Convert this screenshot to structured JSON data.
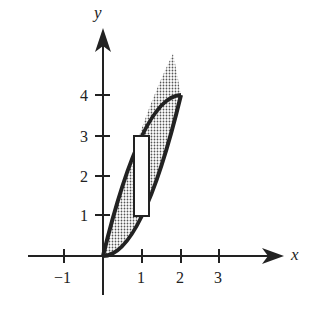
{
  "diagram": {
    "axes": {
      "x_label": "x",
      "y_label": "y",
      "x_ticks": [
        {
          "value": -1,
          "label": "−1"
        },
        {
          "value": 1,
          "label": "1"
        },
        {
          "value": 2,
          "label": "2"
        },
        {
          "value": 3,
          "label": "3"
        }
      ],
      "y_ticks": [
        {
          "value": 1,
          "label": "1"
        },
        {
          "value": 2,
          "label": "2"
        },
        {
          "value": 3,
          "label": "3"
        },
        {
          "value": 4,
          "label": "4"
        }
      ]
    },
    "curves": [
      {
        "name": "upper",
        "equation": "y = 4x - x^2",
        "x_range": [
          0,
          2
        ]
      },
      {
        "name": "lower",
        "equation": "y = x^2",
        "x_range": [
          0,
          2
        ]
      }
    ],
    "shaded_region": {
      "between": [
        "upper",
        "lower"
      ],
      "x_range": [
        0,
        2
      ],
      "pattern": "stipple"
    },
    "rectangle": {
      "x_range": [
        0.8,
        1.2
      ],
      "y_range": [
        1,
        3
      ],
      "fill": "#ffffff"
    },
    "colors": {
      "ink": "#222222",
      "shade": "#9a9a9a",
      "background": "#ffffff"
    }
  }
}
